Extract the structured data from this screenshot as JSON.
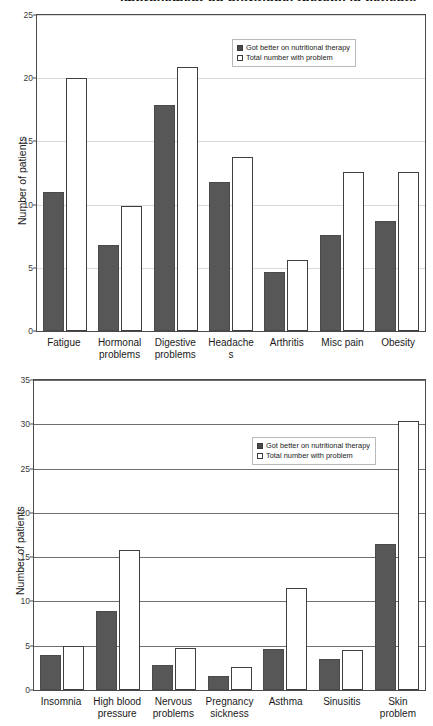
{
  "chart_data": [
    {
      "type": "bar",
      "title": "Improvement on nutritional therapy in patients",
      "xlabel": "",
      "ylabel": "Number of patients",
      "ylim": [
        0,
        25
      ],
      "yticks": [
        0,
        5,
        10,
        15,
        20,
        25
      ],
      "grid": true,
      "legend_position": "top-right",
      "categories": [
        "Fatigue",
        "Hormonal\nproblems",
        "Digestive\nproblems",
        "Headache\ns",
        "Arthritis",
        "Misc pain",
        "Obesity"
      ],
      "series": [
        {
          "name": "Got better on nutritional therapy",
          "color": "#575757",
          "values": [
            11,
            6.8,
            17.9,
            11.8,
            4.7,
            7.6,
            8.7
          ]
        },
        {
          "name": "Total number with problem",
          "color": "#ffffff",
          "values": [
            20,
            9.9,
            20.9,
            13.8,
            5.6,
            12.6,
            12.6
          ]
        }
      ]
    },
    {
      "type": "bar",
      "title": "",
      "xlabel": "",
      "ylabel": "Number of patients",
      "ylim": [
        0,
        35
      ],
      "yticks": [
        0,
        5,
        10,
        15,
        20,
        25,
        30,
        35
      ],
      "grid": true,
      "legend_position": "upper-right",
      "categories": [
        "Insomnia",
        "High blood\npressure",
        "Nervous\nproblems",
        "Pregnancy\nsickness",
        "Asthma",
        "Sinusitis",
        "Skin\nproblem"
      ],
      "series": [
        {
          "name": "Got better on nutritional therapy",
          "color": "#575757",
          "values": [
            4,
            8.9,
            2.8,
            1.6,
            4.6,
            3.5,
            16.5
          ]
        },
        {
          "name": "Total number with problem",
          "color": "#ffffff",
          "values": [
            5,
            15.8,
            4.8,
            2.6,
            11.5,
            4.5,
            30.4
          ]
        }
      ]
    }
  ],
  "chart1": {
    "title": "Improvement on nutritional therapy in patients",
    "ylabel": "Number of patients",
    "yticks": [
      "25",
      "20",
      "15",
      "10",
      "5",
      "0"
    ],
    "categories": [
      "Fatigue",
      "Hormonal\nproblems",
      "Digestive\nproblems",
      "Headache\ns",
      "Arthritis",
      "Misc pain",
      "Obesity"
    ],
    "legend": {
      "dark_label": "Got better on nutritional therapy",
      "light_label": "Total number with problem"
    }
  },
  "chart2": {
    "ylabel": "Number of patients",
    "yticks": [
      "35",
      "30",
      "25",
      "20",
      "15",
      "10",
      "5",
      "0"
    ],
    "categories": [
      "Insomnia",
      "High blood\npressure",
      "Nervous\nproblems",
      "Pregnancy\nsickness",
      "Asthma",
      "Sinusitis",
      "Skin\nproblem"
    ],
    "legend": {
      "dark_label": "Got better on nutritional therapy",
      "light_label": "Total number with problem"
    }
  }
}
